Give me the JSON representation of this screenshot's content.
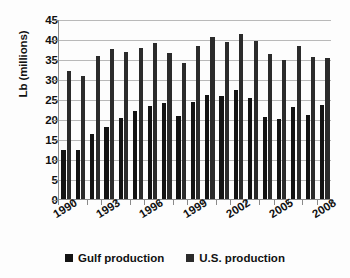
{
  "chart_data": {
    "type": "bar",
    "title": "",
    "xlabel": "",
    "ylabel": "Lb (millions)",
    "ylim": [
      0,
      45
    ],
    "ytick_step": 5,
    "yticks": [
      0,
      5,
      10,
      15,
      20,
      25,
      30,
      35,
      40,
      45
    ],
    "grid": true,
    "grid_axis": "y",
    "legend_position": "bottom",
    "categories": [
      1990,
      1991,
      1992,
      1993,
      1994,
      1995,
      1996,
      1997,
      1998,
      1999,
      2000,
      2001,
      2002,
      2003,
      2004,
      2005,
      2006,
      2007,
      2008
    ],
    "xtick_labels": [
      "1990",
      "1993",
      "1996",
      "1999",
      "2002",
      "2005",
      "2008"
    ],
    "xtick_categories": [
      1990,
      1993,
      1996,
      1999,
      2002,
      2005,
      2008
    ],
    "series": [
      {
        "name": "Gulf production",
        "color": "#131313",
        "values": [
          12.3,
          12.3,
          16.3,
          18.0,
          20.3,
          21.9,
          23.3,
          24.1,
          20.7,
          24.2,
          25.9,
          25.8,
          27.3,
          25.3,
          20.5,
          20.0,
          22.9,
          21.0,
          23.5
        ]
      },
      {
        "name": "U.S. production",
        "color": "#2b2b2b",
        "values": [
          32.0,
          30.8,
          35.8,
          37.5,
          36.8,
          37.7,
          39.0,
          36.5,
          34.0,
          38.2,
          40.6,
          39.3,
          41.3,
          39.4,
          36.2,
          34.8,
          38.3,
          35.4,
          35.3
        ]
      }
    ]
  },
  "legend": {
    "entries": [
      {
        "label": "Gulf production",
        "color": "#131313"
      },
      {
        "label": "U.S. production",
        "color": "#2b2b2b"
      }
    ]
  },
  "axis": {
    "y_title": "Lb (millions)",
    "axis_color": "#8a8a8a",
    "grid_color": "#b9b9b9"
  }
}
